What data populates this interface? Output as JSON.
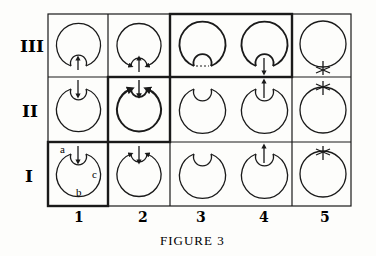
{
  "figure": {
    "caption": "Figure 3",
    "caption_display": "FIGURE 3",
    "row_labels": [
      "III",
      "II",
      "I"
    ],
    "column_labels": [
      "1",
      "2",
      "3",
      "4",
      "5"
    ],
    "cell_annotations": {
      "I-1": [
        "a",
        "b",
        "c"
      ]
    },
    "highlighted_cells": [
      "I-1",
      "II-2",
      "III-3",
      "III-4"
    ],
    "colors": {
      "ink": "#1a1a1a",
      "paper": "#fdfdfb"
    }
  },
  "cells": [
    {
      "row": "III",
      "col": "1",
      "inner": "bottom",
      "arrow": "up-inside",
      "bold": false
    },
    {
      "row": "III",
      "col": "2",
      "inner": "bottom",
      "arrow": "up-inside-with-side-arrows",
      "bold": false
    },
    {
      "row": "III",
      "col": "3",
      "inner": "bottom",
      "arrow": "none",
      "bold": true
    },
    {
      "row": "III",
      "col": "4",
      "inner": "bottom",
      "arrow": "down-out",
      "bold": true
    },
    {
      "row": "III",
      "col": "5",
      "inner": "none",
      "arrow": "cross-bottom",
      "bold": false
    },
    {
      "row": "II",
      "col": "1",
      "inner": "top",
      "arrow": "down-in",
      "bold": false
    },
    {
      "row": "II",
      "col": "2",
      "inner": "top",
      "arrow": "down-in-with-side-arrows",
      "bold": true
    },
    {
      "row": "II",
      "col": "3",
      "inner": "top",
      "arrow": "none",
      "bold": false
    },
    {
      "row": "II",
      "col": "4",
      "inner": "top",
      "arrow": "up-out",
      "bold": false
    },
    {
      "row": "II",
      "col": "5",
      "inner": "none",
      "arrow": "cross-top",
      "bold": false
    },
    {
      "row": "I",
      "col": "1",
      "inner": "top",
      "arrow": "down-in",
      "bold": false
    },
    {
      "row": "I",
      "col": "2",
      "inner": "top",
      "arrow": "down-in-with-side-arrows",
      "bold": false
    },
    {
      "row": "I",
      "col": "3",
      "inner": "top",
      "arrow": "none",
      "bold": false
    },
    {
      "row": "I",
      "col": "4",
      "inner": "top",
      "arrow": "up-out",
      "bold": false
    },
    {
      "row": "I",
      "col": "5",
      "inner": "none",
      "arrow": "cross-top",
      "bold": false
    }
  ]
}
